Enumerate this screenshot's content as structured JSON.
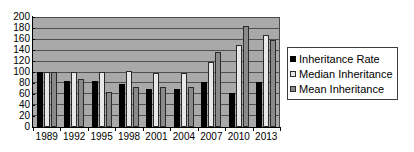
{
  "chart_data": {
    "type": "bar",
    "title": "",
    "subtitle": "",
    "xlabel": "",
    "ylabel": "",
    "categories": [
      "1989",
      "1992",
      "1995",
      "1998",
      "2001",
      "2004",
      "2007",
      "2010",
      "2013"
    ],
    "series": [
      {
        "name": "Inheritance Rate",
        "color": "#000000",
        "values": [
          100,
          83,
          83,
          79,
          70,
          70,
          81,
          61,
          82
        ]
      },
      {
        "name": "Median Inheritance",
        "color": "#e8e8e8",
        "values": [
          100,
          100,
          100,
          101,
          98,
          98,
          118,
          149,
          167
        ]
      },
      {
        "name": "Mean Inheritance",
        "color": "#8a8a8a",
        "values": [
          100,
          87,
          63,
          73,
          72,
          73,
          137,
          183,
          158
        ]
      }
    ],
    "ylim": [
      0,
      200
    ],
    "yticks": [
      0,
      20,
      40,
      60,
      80,
      100,
      120,
      140,
      160,
      180,
      200
    ],
    "grid": true,
    "legend_position": "right",
    "plot_background": "#a9a9a9",
    "gridline_color": "#4f4f4f"
  }
}
